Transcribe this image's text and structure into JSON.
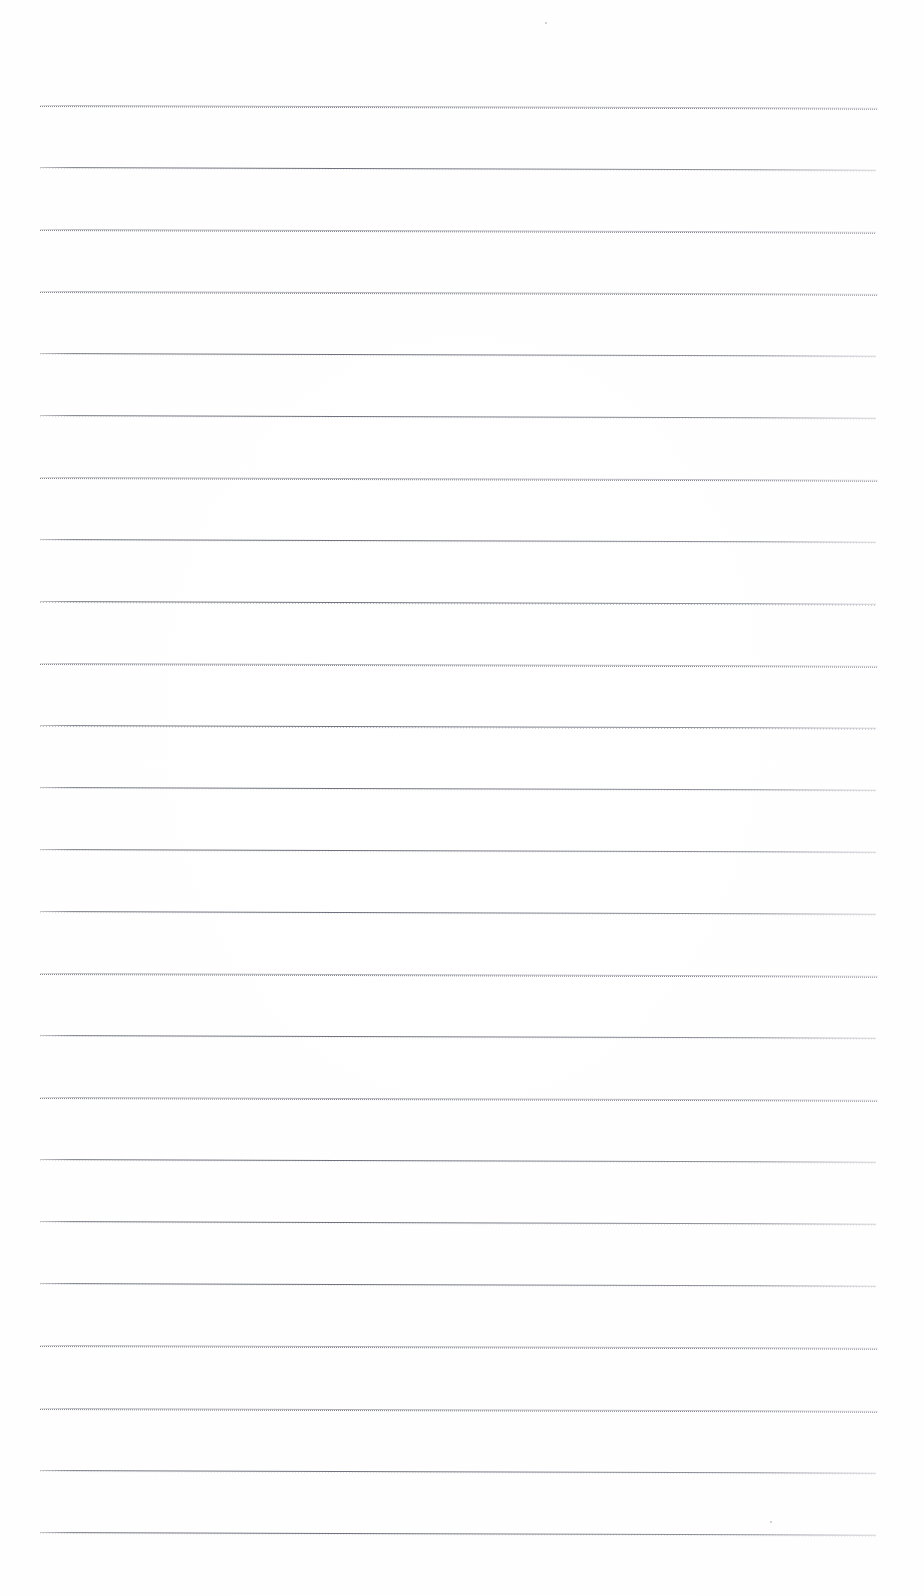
{
  "document": {
    "kind": "scanned-blank-lined-page",
    "title": "Scanned Lined Notebook Page",
    "description": "Blank ruled writing paper, scanned. No text content present.",
    "page_width": 924,
    "page_height": 1595,
    "background_color": "#ffffff",
    "rule_color": "#6b6e7c",
    "rule_color_light": "#9a9ca6",
    "text_content": "",
    "rules": {
      "count": 24,
      "first_line_y": 105,
      "spacing": 62,
      "left_x": 40,
      "right_x": 878,
      "thickness": 1,
      "tilt_degrees": 0.18,
      "lines": [
        {
          "index": 1,
          "y": 105,
          "left": 40,
          "right": 878,
          "style": "dotty"
        },
        {
          "index": 2,
          "y": 167,
          "left": 40,
          "right": 876,
          "style": "crisp"
        },
        {
          "index": 3,
          "y": 229,
          "left": 40,
          "right": 876,
          "style": "dotty"
        },
        {
          "index": 4,
          "y": 291,
          "left": 40,
          "right": 878,
          "style": "dotty"
        },
        {
          "index": 5,
          "y": 353,
          "left": 40,
          "right": 876,
          "style": "crisp"
        },
        {
          "index": 6,
          "y": 415,
          "left": 40,
          "right": 876,
          "style": "crisp"
        },
        {
          "index": 7,
          "y": 477,
          "left": 40,
          "right": 878,
          "style": "dotty"
        },
        {
          "index": 8,
          "y": 539,
          "left": 40,
          "right": 876,
          "style": "crisp"
        },
        {
          "index": 9,
          "y": 601,
          "left": 40,
          "right": 876,
          "style": "normal"
        },
        {
          "index": 10,
          "y": 663,
          "left": 40,
          "right": 878,
          "style": "dotty"
        },
        {
          "index": 11,
          "y": 725,
          "left": 40,
          "right": 876,
          "style": "normal"
        },
        {
          "index": 12,
          "y": 787,
          "left": 40,
          "right": 876,
          "style": "crisp"
        },
        {
          "index": 13,
          "y": 849,
          "left": 40,
          "right": 876,
          "style": "crisp"
        },
        {
          "index": 14,
          "y": 911,
          "left": 40,
          "right": 876,
          "style": "crisp"
        },
        {
          "index": 15,
          "y": 973,
          "left": 40,
          "right": 878,
          "style": "dotty"
        },
        {
          "index": 16,
          "y": 1035,
          "left": 40,
          "right": 876,
          "style": "crisp"
        },
        {
          "index": 17,
          "y": 1097,
          "left": 40,
          "right": 878,
          "style": "dotty"
        },
        {
          "index": 18,
          "y": 1159,
          "left": 40,
          "right": 876,
          "style": "crisp"
        },
        {
          "index": 19,
          "y": 1221,
          "left": 40,
          "right": 876,
          "style": "crisp"
        },
        {
          "index": 20,
          "y": 1283,
          "left": 40,
          "right": 876,
          "style": "crisp"
        },
        {
          "index": 21,
          "y": 1345,
          "left": 40,
          "right": 878,
          "style": "dotty"
        },
        {
          "index": 22,
          "y": 1408,
          "left": 40,
          "right": 878,
          "style": "dotty"
        },
        {
          "index": 23,
          "y": 1470,
          "left": 40,
          "right": 876,
          "style": "crisp"
        },
        {
          "index": 24,
          "y": 1532,
          "left": 40,
          "right": 876,
          "style": "crisp"
        }
      ]
    },
    "artifacts": [
      {
        "name": "scan-speck-top",
        "x": 545,
        "y": 22,
        "size": 2
      },
      {
        "name": "scan-speck-bottom",
        "x": 770,
        "y": 1521,
        "size": 2
      }
    ]
  }
}
